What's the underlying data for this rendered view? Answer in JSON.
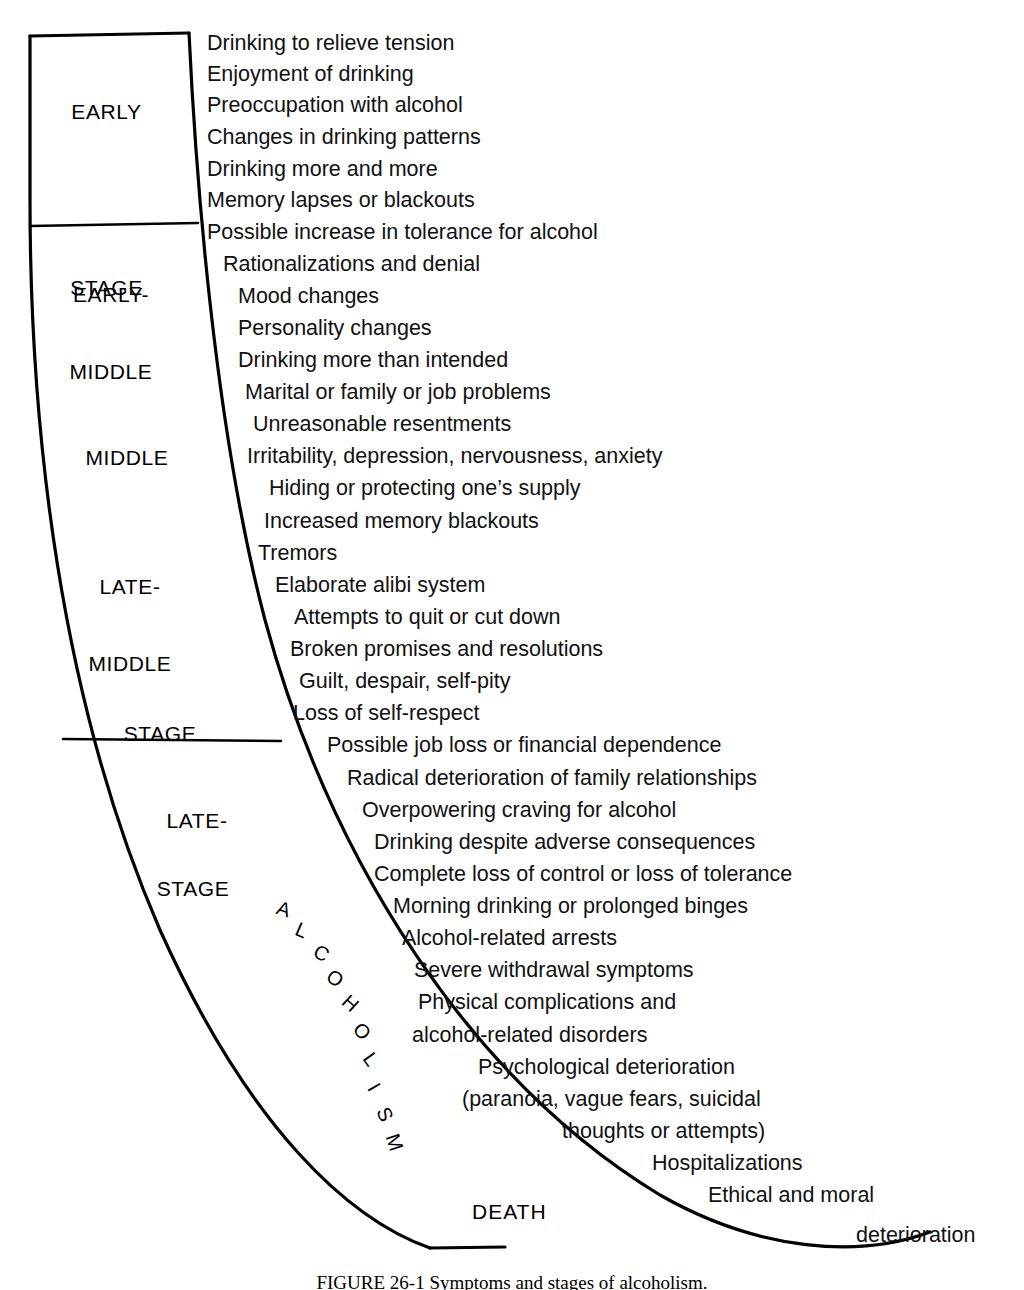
{
  "figure": {
    "caption": "FIGURE 26-1 Symptoms and stages of alcoholism.",
    "arc_word_letters": [
      "A",
      "L",
      "C",
      "O",
      "H",
      "O",
      "L",
      "I",
      "S",
      "M"
    ],
    "arc_word": "ALCOHOLISM",
    "death_label": "DEATH"
  },
  "stages": [
    {
      "id": "early-stage",
      "lines": [
        "EARLY",
        "STAGE"
      ]
    },
    {
      "id": "early-middle",
      "lines": [
        "EARLY-",
        "MIDDLE"
      ]
    },
    {
      "id": "middle",
      "lines": [
        "MIDDLE"
      ]
    },
    {
      "id": "late-middle",
      "lines": [
        "LATE-",
        "MIDDLE"
      ]
    },
    {
      "id": "middle-stage-word",
      "lines": [
        "STAGE"
      ]
    },
    {
      "id": "late-stage-1",
      "lines": [
        "LATE-"
      ]
    },
    {
      "id": "late-stage-2",
      "lines": [
        "STAGE"
      ]
    }
  ],
  "symptoms": [
    {
      "text": "Drinking to relieve tension",
      "x": 207,
      "y": 33
    },
    {
      "text": "Enjoyment of drinking",
      "x": 207,
      "y": 64
    },
    {
      "text": "Preoccupation with alcohol",
      "x": 207,
      "y": 95
    },
    {
      "text": "Changes in drinking patterns",
      "x": 207,
      "y": 127
    },
    {
      "text": "Drinking more and more",
      "x": 207,
      "y": 159
    },
    {
      "text": "Memory lapses or blackouts",
      "x": 207,
      "y": 190
    },
    {
      "text": "Possible increase in tolerance for alcohol",
      "x": 207,
      "y": 222
    },
    {
      "text": "Rationalizations and denial",
      "x": 223,
      "y": 254
    },
    {
      "text": "Mood changes",
      "x": 238,
      "y": 286
    },
    {
      "text": "Personality changes",
      "x": 238,
      "y": 318
    },
    {
      "text": "Drinking more than intended",
      "x": 238,
      "y": 350
    },
    {
      "text": "Marital or family or job problems",
      "x": 245,
      "y": 382
    },
    {
      "text": "Unreasonable resentments",
      "x": 253,
      "y": 414
    },
    {
      "text": "Irritability, depression, nervousness, anxiety",
      "x": 247,
      "y": 446
    },
    {
      "text": "Hiding or protecting one’s supply",
      "x": 269,
      "y": 478
    },
    {
      "text": "Increased memory blackouts",
      "x": 264,
      "y": 511
    },
    {
      "text": "Tremors",
      "x": 258,
      "y": 543
    },
    {
      "text": "Elaborate alibi system",
      "x": 275,
      "y": 575
    },
    {
      "text": "Attempts to quit or cut down",
      "x": 294,
      "y": 607
    },
    {
      "text": "Broken promises and resolutions",
      "x": 290,
      "y": 639
    },
    {
      "text": "Guilt, despair, self-pity",
      "x": 299,
      "y": 671
    },
    {
      "text": "Loss of self-respect",
      "x": 293,
      "y": 703
    },
    {
      "text": "Possible job loss or financial dependence",
      "x": 327,
      "y": 735
    },
    {
      "text": "Radical deterioration of family relationships",
      "x": 347,
      "y": 768
    },
    {
      "text": "Overpowering craving for alcohol",
      "x": 362,
      "y": 800
    },
    {
      "text": "Drinking despite adverse consequences",
      "x": 374,
      "y": 832
    },
    {
      "text": "Complete loss of control or loss of tolerance",
      "x": 374,
      "y": 864
    },
    {
      "text": "Morning drinking or prolonged binges",
      "x": 393,
      "y": 896
    },
    {
      "text": "Alcohol-related arrests",
      "x": 402,
      "y": 928
    },
    {
      "text": "Severe withdrawal symptoms",
      "x": 414,
      "y": 960
    },
    {
      "text": "Physical complications and",
      "x": 418,
      "y": 992
    },
    {
      "text": "alcohol-related disorders",
      "x": 412,
      "y": 1025
    },
    {
      "text": "Psychological deterioration",
      "x": 478,
      "y": 1057
    },
    {
      "text": "(paranoia, vague fears, suicidal",
      "x": 462,
      "y": 1089
    },
    {
      "text": "thoughts or attempts)",
      "x": 562,
      "y": 1121
    },
    {
      "text": "Hospitalizations",
      "x": 652,
      "y": 1153
    },
    {
      "text": "Ethical and moral",
      "x": 708,
      "y": 1185
    },
    {
      "text": "deterioration",
      "x": 856,
      "y": 1225
    }
  ],
  "arc_letters": [
    {
      "ch": "A",
      "x": 277,
      "y": 898,
      "rot": 18
    },
    {
      "ch": "L",
      "x": 296,
      "y": 919,
      "rot": 24
    },
    {
      "ch": "C",
      "x": 314,
      "y": 942,
      "rot": 30
    },
    {
      "ch": "O",
      "x": 327,
      "y": 967,
      "rot": 36
    },
    {
      "ch": "H",
      "x": 343,
      "y": 992,
      "rot": 42
    },
    {
      "ch": "O",
      "x": 354,
      "y": 1020,
      "rot": 48
    },
    {
      "ch": "L",
      "x": 365,
      "y": 1048,
      "rot": 54
    },
    {
      "ch": "I",
      "x": 371,
      "y": 1076,
      "rot": 60
    },
    {
      "ch": "S",
      "x": 378,
      "y": 1103,
      "rot": 66
    },
    {
      "ch": "M",
      "x": 386,
      "y": 1131,
      "rot": 72
    }
  ],
  "stage_label_positions": [
    {
      "id": "early-stage",
      "x": 34,
      "y": 48,
      "w": 145
    },
    {
      "id": "early-middle",
      "x": 31,
      "y": 231,
      "w": 160
    },
    {
      "id": "middle",
      "x": 47,
      "y": 394,
      "w": 160
    },
    {
      "id": "late-middle",
      "x": 50,
      "y": 523,
      "w": 160
    },
    {
      "id": "middle-stage-word",
      "x": 80,
      "y": 670,
      "w": 160
    },
    {
      "id": "late-stage-1",
      "x": 117,
      "y": 757,
      "w": 160
    },
    {
      "id": "late-stage-2",
      "x": 113,
      "y": 825,
      "w": 160
    }
  ],
  "death_position": {
    "x": 472,
    "y": 1200
  },
  "colors": {
    "ink": "#000000",
    "paper": "#ffffff"
  }
}
